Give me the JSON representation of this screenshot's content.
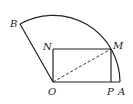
{
  "diagram": {
    "type": "geometry",
    "colors": {
      "stroke": "#222222",
      "background": "#ffffff"
    },
    "points": {
      "O": {
        "label": "O",
        "x": 53,
        "y": 82
      },
      "A": {
        "label": "A",
        "x": 120,
        "y": 82
      },
      "B": {
        "label": "B",
        "x": 20,
        "y": 24
      },
      "M": {
        "label": "M",
        "x": 111,
        "y": 49
      },
      "N": {
        "label": "N",
        "x": 53,
        "y": 49
      },
      "P": {
        "label": "P",
        "x": 111,
        "y": 82
      }
    },
    "segments": [
      {
        "from": "O",
        "to": "A",
        "style": "solid"
      },
      {
        "from": "O",
        "to": "B",
        "style": "solid"
      },
      {
        "from": "O",
        "to": "N",
        "style": "solid"
      },
      {
        "from": "N",
        "to": "M",
        "style": "solid"
      },
      {
        "from": "M",
        "to": "P",
        "style": "solid"
      },
      {
        "from": "O",
        "to": "M",
        "style": "dashed"
      }
    ],
    "arcs": [
      {
        "center": "O",
        "from": "B",
        "to": "A",
        "radius": 67
      }
    ]
  }
}
